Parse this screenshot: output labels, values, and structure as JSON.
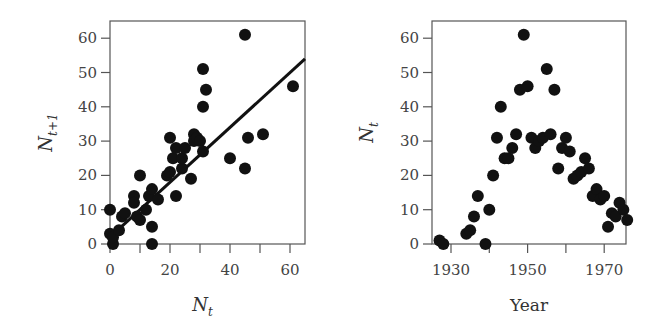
{
  "chart_data": [
    {
      "type": "scatter",
      "title": "",
      "xlabel": "N_t",
      "ylabel": "N_t+1",
      "xlabel_main": "N",
      "xlabel_sub": "t",
      "ylabel_main": "N",
      "ylabel_sub": "t+1",
      "xlim": [
        -2,
        65
      ],
      "ylim": [
        -1,
        65
      ],
      "xticks": [
        0,
        20,
        40,
        60
      ],
      "xminor_ticks": [
        10,
        30,
        50
      ],
      "yticks": [
        0,
        10,
        20,
        30,
        40,
        50,
        60
      ],
      "xtick_labels": [
        "0",
        "20",
        "40",
        "60"
      ],
      "ytick_labels": [
        "0",
        "10",
        "20",
        "30",
        "40",
        "50",
        "60"
      ],
      "grid": false,
      "fit_line": {
        "x": [
          0,
          65
        ],
        "y": [
          2,
          54
        ]
      },
      "points": [
        [
          0,
          10
        ],
        [
          0,
          3
        ],
        [
          1,
          0
        ],
        [
          1,
          2
        ],
        [
          3,
          4
        ],
        [
          4,
          8
        ],
        [
          5,
          9
        ],
        [
          8,
          14
        ],
        [
          8,
          12
        ],
        [
          9,
          8
        ],
        [
          10,
          20
        ],
        [
          10,
          7
        ],
        [
          12,
          10
        ],
        [
          13,
          14
        ],
        [
          14,
          16
        ],
        [
          14,
          5
        ],
        [
          14,
          0
        ],
        [
          16,
          13
        ],
        [
          19,
          20
        ],
        [
          20,
          31
        ],
        [
          20,
          21
        ],
        [
          21,
          25
        ],
        [
          22,
          28
        ],
        [
          22,
          14
        ],
        [
          24,
          22
        ],
        [
          24,
          25
        ],
        [
          25,
          28
        ],
        [
          27,
          19
        ],
        [
          28,
          32
        ],
        [
          28,
          30
        ],
        [
          29,
          31
        ],
        [
          30,
          30
        ],
        [
          31,
          27
        ],
        [
          31,
          51
        ],
        [
          31,
          40
        ],
        [
          32,
          45
        ],
        [
          40,
          25
        ],
        [
          45,
          61
        ],
        [
          45,
          22
        ],
        [
          46,
          31
        ],
        [
          51,
          32
        ],
        [
          61,
          46
        ]
      ]
    },
    {
      "type": "scatter",
      "title": "",
      "xlabel": "Year",
      "ylabel": "N_t",
      "ylabel_main": "N",
      "ylabel_sub": "t",
      "xlim": [
        1925,
        1977
      ],
      "ylim": [
        -1,
        65
      ],
      "xticks": [
        1930,
        1950,
        1970
      ],
      "xminor_ticks": [
        1940,
        1960
      ],
      "yticks": [
        0,
        10,
        20,
        30,
        40,
        50,
        60
      ],
      "xtick_labels": [
        "1930",
        "1950",
        "1970"
      ],
      "ytick_labels": [
        "0",
        "10",
        "20",
        "30",
        "40",
        "50",
        "60"
      ],
      "grid": false,
      "points": [
        [
          1927,
          1
        ],
        [
          1928,
          0
        ],
        [
          1934,
          3
        ],
        [
          1935,
          4
        ],
        [
          1936,
          8
        ],
        [
          1937,
          14
        ],
        [
          1939,
          0
        ],
        [
          1940,
          10
        ],
        [
          1941,
          20
        ],
        [
          1942,
          31
        ],
        [
          1943,
          40
        ],
        [
          1944,
          25
        ],
        [
          1945,
          25
        ],
        [
          1946,
          28
        ],
        [
          1947,
          32
        ],
        [
          1948,
          45
        ],
        [
          1949,
          61
        ],
        [
          1950,
          46
        ],
        [
          1951,
          31
        ],
        [
          1952,
          28
        ],
        [
          1953,
          30
        ],
        [
          1954,
          31
        ],
        [
          1955,
          51
        ],
        [
          1956,
          32
        ],
        [
          1957,
          45
        ],
        [
          1958,
          22
        ],
        [
          1959,
          28
        ],
        [
          1960,
          31
        ],
        [
          1961,
          27
        ],
        [
          1962,
          19
        ],
        [
          1963,
          20
        ],
        [
          1964,
          21
        ],
        [
          1965,
          25
        ],
        [
          1966,
          22
        ],
        [
          1967,
          14
        ],
        [
          1968,
          16
        ],
        [
          1969,
          13
        ],
        [
          1970,
          14
        ],
        [
          1971,
          5
        ],
        [
          1972,
          9
        ],
        [
          1973,
          8
        ],
        [
          1974,
          12
        ],
        [
          1975,
          10
        ],
        [
          1976,
          7
        ]
      ]
    }
  ]
}
